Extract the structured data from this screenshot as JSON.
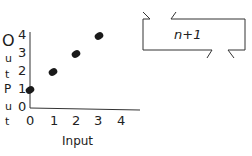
{
  "chart_data": {
    "type": "scatter",
    "title": "",
    "xlabel": "Input",
    "ylabel": "Output",
    "x": [
      0,
      1,
      2,
      3
    ],
    "y": [
      1,
      2,
      3,
      4
    ],
    "x_ticks": [
      "0",
      "1",
      "2",
      "3",
      "4"
    ],
    "y_ticks": [
      "0",
      "1",
      "2",
      "3",
      "4"
    ],
    "xlim": [
      0,
      4
    ],
    "ylim": [
      0,
      4
    ],
    "grid": false,
    "annotations": [
      "n+1"
    ]
  },
  "ylabel_letters": [
    "O",
    "u",
    "t",
    "P",
    "u",
    "t"
  ],
  "machine": {
    "rule": "n+1"
  },
  "colors": {
    "ink": "#1a1a1a",
    "background": "#ffffff"
  }
}
